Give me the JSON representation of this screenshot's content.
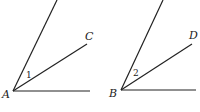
{
  "figures": [
    {
      "vertex": "A",
      "ray_label": "C",
      "angle_label": "1",
      "vertex_pt": [
        13,
        91
      ],
      "top_end": [
        57,
        0
      ],
      "ray_end": [
        87,
        44
      ],
      "base_end": [
        90,
        91
      ],
      "vertex_label_pos": [
        2,
        98
      ],
      "ray_label_pos": [
        85,
        40
      ],
      "angle_label_pos": [
        27,
        78
      ]
    },
    {
      "vertex": "B",
      "ray_label": "D",
      "angle_label": "2",
      "vertex_pt": [
        121,
        90
      ],
      "top_end": [
        163,
        0
      ],
      "ray_end": [
        192,
        44
      ],
      "base_end": [
        196,
        90
      ],
      "vertex_label_pos": [
        109,
        97
      ],
      "ray_label_pos": [
        189,
        40
      ],
      "angle_label_pos": [
        134,
        77
      ]
    }
  ],
  "colors": {
    "stroke": "#222222"
  }
}
